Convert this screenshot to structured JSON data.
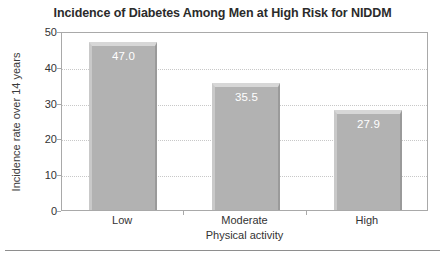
{
  "chart_data": {
    "type": "bar",
    "title": "Incidence of Diabetes Among Men at High Risk for NIDDM",
    "xlabel": "Physical activity",
    "ylabel": "Incidence rate over 14 years",
    "categories": [
      "Low",
      "Moderate",
      "High"
    ],
    "values": [
      47.0,
      35.5,
      27.9
    ],
    "value_labels": [
      "47.0",
      "35.5",
      "27.9"
    ],
    "ylim": [
      0,
      50
    ],
    "yticks": [
      0,
      10,
      20,
      30,
      40,
      50
    ],
    "ytick_labels": [
      "0",
      "10",
      "20",
      "30",
      "40",
      "50"
    ],
    "grid": "horizontal-dotted",
    "legend": "none",
    "bar_color": "#b2b2b2",
    "value_label_color": "#ffffff",
    "frame_color": "#a9a9a9",
    "gridline_color": "#c8c8c8",
    "title_color": "#2b2b2b"
  }
}
